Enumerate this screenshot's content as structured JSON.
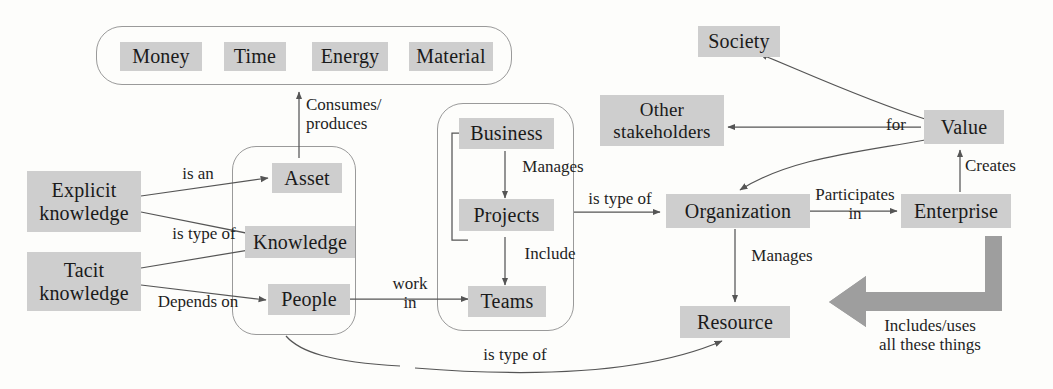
{
  "diagram": {
    "colors": {
      "node_fill": "#cecece",
      "group_stroke": "#9a9a9a",
      "arrow_stroke": "#555555",
      "thick_arrow_fill": "#9e9e9e",
      "text": "#1a1a1a",
      "background": "#fdfdfb"
    },
    "groups": [
      {
        "id": "resources-group",
        "label": ""
      },
      {
        "id": "assets-group",
        "label": ""
      },
      {
        "id": "business-group",
        "label": ""
      }
    ],
    "nodes": {
      "money": "Money",
      "time": "Time",
      "energy": "Energy",
      "material": "Material",
      "explicit_knowledge": "Explicit\nknowledge",
      "tacit_knowledge": "Tacit\nknowledge",
      "asset": "Asset",
      "knowledge": "Knowledge",
      "people": "People",
      "business": "Business",
      "projects": "Projects",
      "teams": "Teams",
      "society": "Society",
      "other_stakeholders": "Other\nstakeholders",
      "value": "Value",
      "organization": "Organization",
      "enterprise": "Enterprise",
      "resource": "Resource"
    },
    "edge_labels": {
      "consumes_produces": "Consumes/\nproduces",
      "is_an": "is an",
      "is_type_of_knowledge": "is type of",
      "depends_on": "Depends on",
      "manages_projects": "Manages",
      "include": "Include",
      "work_in": "work\nin",
      "is_type_of_org": "is type of",
      "participates_in": "Participates\nin",
      "creates": "Creates",
      "for": "for",
      "manages_resource": "Manages",
      "is_type_of_resource": "is type of",
      "includes_uses": "Includes/uses\nall these things"
    }
  }
}
